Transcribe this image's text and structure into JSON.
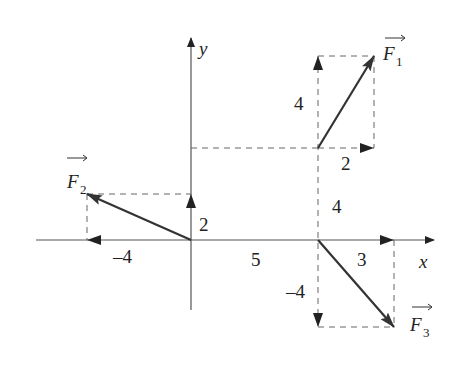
{
  "figure": {
    "type": "vector-diagram",
    "axes": {
      "x_label": "x",
      "y_label": "y"
    },
    "vectors": [
      {
        "name": "F",
        "subscript": "1",
        "components": {
          "x": 2,
          "y": 4
        },
        "x_label": "2",
        "y_label": "4"
      },
      {
        "name": "F",
        "subscript": "2",
        "components": {
          "x": -4,
          "y": 2
        },
        "x_label": "–4",
        "y_label": "2"
      },
      {
        "name": "F",
        "subscript": "3",
        "components": {
          "x": 3,
          "y": -4
        },
        "x_label": "3",
        "y_label": "–4"
      }
    ],
    "offsets": {
      "x_label": "5",
      "y_label": "4"
    },
    "colors": {
      "axis": "#555555",
      "vector": "#333333",
      "dashed": "#666666",
      "text": "#222222"
    }
  }
}
